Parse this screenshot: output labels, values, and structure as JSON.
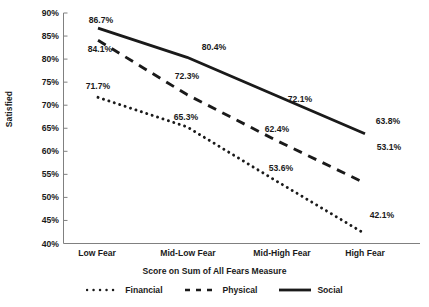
{
  "chart_data": {
    "type": "line",
    "title": "",
    "xlabel": "Score on Sum of All Fears Measure",
    "ylabel": "Satisfied",
    "categories": [
      "Low Fear",
      "Mid-Low Fear",
      "Mid-High Fear",
      "High Fear"
    ],
    "ylim": [
      40,
      90
    ],
    "ytick_labels": [
      "90%",
      "85%",
      "80%",
      "75%",
      "70%",
      "65%",
      "60%",
      "55%",
      "50%",
      "45%",
      "40%"
    ],
    "ytick_values": [
      90,
      85,
      80,
      75,
      70,
      65,
      60,
      55,
      50,
      45,
      40
    ],
    "grid": false,
    "legend_position": "bottom",
    "series": [
      {
        "name": "Financial",
        "style": "dotted",
        "color": "#1a1a1a",
        "values": [
          71.7,
          65.3,
          53.6,
          42.1
        ],
        "labels": [
          "71.7%",
          "65.3%",
          "53.6%",
          "42.1%"
        ]
      },
      {
        "name": "Physical",
        "style": "dashed",
        "color": "#1a1a1a",
        "values": [
          84.1,
          72.3,
          62.4,
          53.1
        ],
        "labels": [
          "84.1%",
          "72.3%",
          "62.4%",
          "53.1%"
        ]
      },
      {
        "name": "Social",
        "style": "solid",
        "color": "#1a1a1a",
        "values": [
          86.7,
          80.4,
          72.1,
          63.8
        ],
        "labels": [
          "86.7%",
          "80.4%",
          "72.1%",
          "63.8%"
        ]
      }
    ]
  },
  "axis": {
    "y_title": "Satisfied",
    "x_title": "Score on Sum of All Fears Measure",
    "yticks": [
      {
        "label": "90%"
      },
      {
        "label": "85%"
      },
      {
        "label": "80%"
      },
      {
        "label": "75%"
      },
      {
        "label": "70%"
      },
      {
        "label": "65%"
      },
      {
        "label": "60%"
      },
      {
        "label": "55%"
      },
      {
        "label": "50%"
      },
      {
        "label": "45%"
      },
      {
        "label": "40%"
      }
    ],
    "xticks": [
      {
        "label": "Low Fear"
      },
      {
        "label": "Mid-Low Fear"
      },
      {
        "label": "Mid-High Fear"
      },
      {
        "label": "High Fear"
      }
    ]
  },
  "legend": {
    "items": [
      {
        "label": "Financial",
        "style": "dotted"
      },
      {
        "label": "Physical",
        "style": "dashed"
      },
      {
        "label": "Social",
        "style": "solid"
      }
    ]
  },
  "data_labels": [
    {
      "text": "86.7%",
      "series": "Social",
      "x": 101,
      "y": 20
    },
    {
      "text": "80.4%",
      "series": "Social",
      "x": 214,
      "y": 47
    },
    {
      "text": "72.1%",
      "series": "Social",
      "x": 300,
      "y": 99
    },
    {
      "text": "63.8%",
      "series": "Social",
      "x": 388,
      "y": 121
    },
    {
      "text": "84.1%",
      "series": "Physical",
      "x": 100,
      "y": 49
    },
    {
      "text": "72.3%",
      "series": "Physical",
      "x": 187,
      "y": 76
    },
    {
      "text": "62.4%",
      "series": "Physical",
      "x": 277,
      "y": 129
    },
    {
      "text": "53.1%",
      "series": "Physical",
      "x": 389,
      "y": 147
    },
    {
      "text": "71.7%",
      "series": "Financial",
      "x": 98,
      "y": 86
    },
    {
      "text": "65.3%",
      "series": "Financial",
      "x": 186,
      "y": 117
    },
    {
      "text": "53.6%",
      "series": "Financial",
      "x": 281,
      "y": 168
    },
    {
      "text": "42.1%",
      "series": "Financial",
      "x": 382,
      "y": 215
    }
  ],
  "colors": {
    "ink": "#1a1a1a",
    "axis": "#808080",
    "background": "#ffffff"
  }
}
